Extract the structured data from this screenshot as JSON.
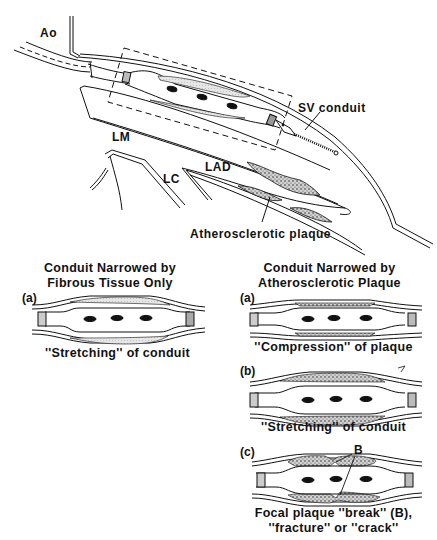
{
  "main_diagram": {
    "labels": {
      "aorta": "Ao",
      "left_main": "LM",
      "left_circumflex": "LC",
      "lad": "LAD",
      "sv_conduit": "SV conduit",
      "plaque": "Atherosclerotic plaque"
    }
  },
  "left_panel": {
    "title_line1": "Conduit Narrowed by",
    "title_line2": "Fibrous Tissue Only",
    "panels": [
      {
        "letter": "(a)",
        "caption": "''Stretching'' of conduit"
      }
    ]
  },
  "right_panel": {
    "title_line1": "Conduit Narrowed by",
    "title_line2": "Atherosclerotic Plaque",
    "panels": [
      {
        "letter": "(a)",
        "caption": "''Compression'' of plaque"
      },
      {
        "letter": "(b)",
        "caption": "''Stretching'' of conduit"
      },
      {
        "letter": "(c)",
        "caption_line1": "Focal plaque ''break'' (B),",
        "caption_line2": "''fracture'' or ''crack''",
        "marker": "B"
      }
    ]
  },
  "colors": {
    "ink": "#111111",
    "plaque_fill": "#9a9a9a",
    "fibrous_fill": "#d8d8d8",
    "background": "#ffffff"
  }
}
